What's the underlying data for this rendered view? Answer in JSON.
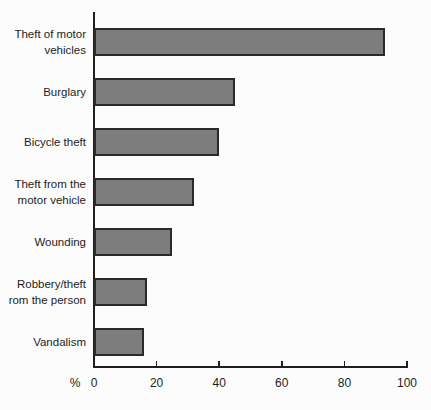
{
  "chart_data": {
    "type": "bar",
    "orientation": "horizontal",
    "title": "",
    "xlabel": "%",
    "ylabel": "",
    "categories": [
      "Theft of motor\nvehicles",
      "Burglary",
      "Bicycle theft",
      "Theft from the\nmotor vehicle",
      "Wounding",
      "Robbery/theft\nrom the person",
      "Vandalism"
    ],
    "values": [
      93,
      45,
      40,
      32,
      25,
      17,
      16
    ],
    "xlim": [
      0,
      100
    ],
    "x_ticks": [
      0,
      20,
      40,
      60,
      80,
      100
    ],
    "grid": false,
    "legend": false,
    "bar_fill_color": "#7d7d7d",
    "bar_border_color": "#2a2a2a",
    "axis_color": "#1f1f1f",
    "background_color": "#fcfcfc"
  }
}
